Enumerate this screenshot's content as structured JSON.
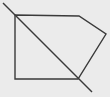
{
  "canvas": {
    "width": 110,
    "height": 97,
    "background": "#ebebeb"
  },
  "stroke": {
    "color": "#3a3a3a",
    "width": 1.4
  },
  "pentagon": {
    "points": [
      [
        15,
        15
      ],
      [
        79,
        16
      ],
      [
        106,
        34
      ],
      [
        78,
        79
      ],
      [
        15,
        79
      ]
    ]
  },
  "diagonal": {
    "x1": 3,
    "y1": 3,
    "x2": 92,
    "y2": 92
  }
}
